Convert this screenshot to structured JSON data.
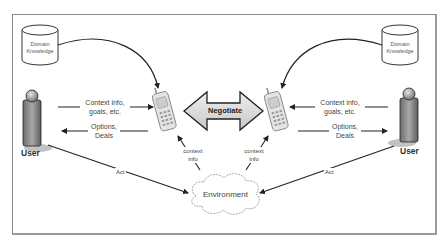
{
  "diagram": {
    "left": {
      "knowledge": {
        "line1": "Domain",
        "line2": "Knowledge"
      },
      "user": "User",
      "to_agent": {
        "line1": "Context info,",
        "line2": "goals, etc."
      },
      "to_user": {
        "line1": "Options,",
        "line2": "Deals"
      },
      "act": "Act",
      "context": {
        "line1": "context",
        "line2": "info"
      }
    },
    "right": {
      "knowledge": {
        "line1": "Domain",
        "line2": "Knowledge"
      },
      "user": "User",
      "to_agent": {
        "line1": "Context info,",
        "line2": "goals, etc."
      },
      "to_user": {
        "line1": "Options,",
        "line2": "Deals"
      },
      "act": "Act",
      "context": {
        "line1": "context",
        "line2": "info"
      }
    },
    "center": {
      "negotiate": "Negotiate",
      "environment": "Environment"
    },
    "colors": {
      "line": "#333333",
      "frame": "#8a8a8a",
      "arrow_fill": "#d8d8d8",
      "person": "#8c8c8c"
    }
  }
}
